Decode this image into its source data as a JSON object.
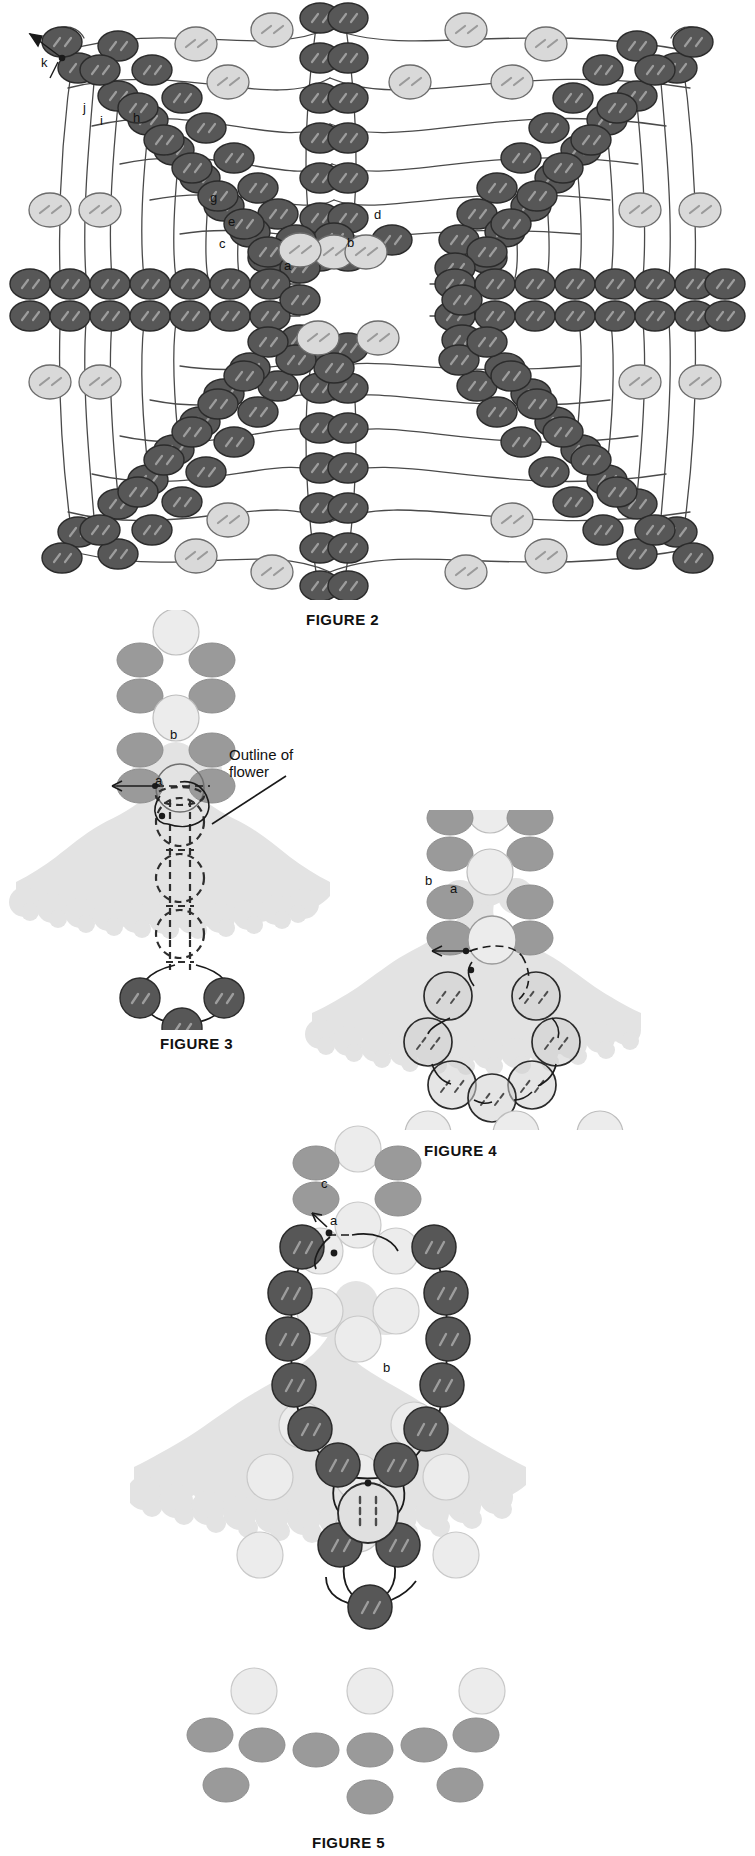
{
  "document": {
    "type": "beadwork-instruction-diagram",
    "background_color": "#ffffff",
    "ink_color": "#1a1a1a"
  },
  "palette": {
    "dark_bead": "#575757",
    "dark_bead_stroke": "#2b2b2b",
    "mid_bead": "#9a9a9a",
    "light_bead": "#d7d7d7",
    "pale_bead": "#e6e6e6",
    "flower_fill": "#e3e3e3",
    "thread": "#4a4a4a",
    "dash": "#7a7a7a"
  },
  "figures": [
    {
      "id": "figure-2",
      "label": "FIGURE 2",
      "caption_position": {
        "x": 306,
        "y": 611
      },
      "description": "Large symmetric beaded netting lattice worked in dark and light seed beads",
      "callouts": [
        {
          "text": "k",
          "x": 41,
          "y": 62
        },
        {
          "text": "j",
          "x": 83,
          "y": 107
        },
        {
          "text": "i",
          "x": 100,
          "y": 120
        },
        {
          "text": "h",
          "x": 133,
          "y": 117
        },
        {
          "text": "g",
          "x": 210,
          "y": 197
        },
        {
          "text": "e",
          "x": 228,
          "y": 221
        },
        {
          "text": "c",
          "x": 219,
          "y": 243
        },
        {
          "text": "a",
          "x": 284,
          "y": 265
        },
        {
          "text": "b",
          "x": 347,
          "y": 242
        },
        {
          "text": "d",
          "x": 374,
          "y": 214
        }
      ]
    },
    {
      "id": "figure-3",
      "label": "FIGURE 3",
      "caption_position": {
        "x": 160,
        "y": 1040
      },
      "description": "Single stamen column with flower outline shown in dashed line and a three-bead picot tip",
      "callouts": [
        {
          "text": "b",
          "x": 172,
          "y": 734
        },
        {
          "text": "a",
          "x": 158,
          "y": 779
        },
        {
          "text": "Outline of",
          "x": 229,
          "y": 754
        },
        {
          "text": "flower",
          "x": 229,
          "y": 770
        }
      ]
    },
    {
      "id": "figure-4",
      "label": "FIGURE 4",
      "caption_position": {
        "x": 424,
        "y": 1148
      },
      "description": "Flower with a ring of seven beads forming the flower center",
      "callouts": [
        {
          "text": "b",
          "x": 427,
          "y": 880
        },
        {
          "text": "a",
          "x": 452,
          "y": 888
        }
      ]
    },
    {
      "id": "figure-5",
      "label": "FIGURE 5",
      "caption_position": {
        "x": 312,
        "y": 1840
      },
      "description": "Flower with dark bead outer ring worked around the flower center and a dangling picot",
      "callouts": [
        {
          "text": "c",
          "x": 343,
          "y": 1182
        },
        {
          "text": "a",
          "x": 352,
          "y": 1217
        },
        {
          "text": "b",
          "x": 388,
          "y": 1367
        }
      ]
    }
  ],
  "legend_terms": {
    "outline_of_flower": "Outline of flower"
  }
}
